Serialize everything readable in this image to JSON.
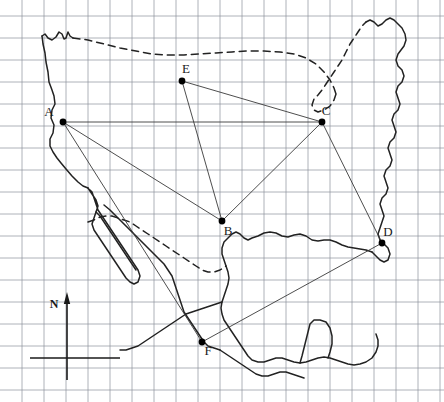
{
  "figure": {
    "type": "map",
    "title": ""
  },
  "grid": {
    "visible": true,
    "spacing_px": 22,
    "x_start": 22,
    "y_start": 16,
    "columns": 19,
    "rows": 18,
    "color": "#8a8f99",
    "line_width": 0.8
  },
  "compass": {
    "label": "N",
    "direction": "north",
    "arrow_color": "#1a1a1a",
    "axis_x": 67,
    "axis_top_y": 300,
    "axis_bottom_y": 380,
    "crossbar_y": 358,
    "crossbar_x1": 30,
    "crossbar_x2": 120,
    "label_x": 54,
    "label_y": 308
  },
  "points": [
    {
      "id": "A",
      "label": "A",
      "x": 63,
      "y": 122,
      "label_dx": -14,
      "label_dy": -6
    },
    {
      "id": "B",
      "label": "B",
      "x": 222,
      "y": 221,
      "label_dx": 6,
      "label_dy": 14
    },
    {
      "id": "C",
      "label": "C",
      "x": 322,
      "y": 122,
      "label_dx": 4,
      "label_dy": -7
    },
    {
      "id": "D",
      "label": "D",
      "x": 382,
      "y": 243,
      "label_dx": 6,
      "label_dy": -7
    },
    {
      "id": "E",
      "label": "E",
      "x": 182,
      "y": 81,
      "label_dx": 4,
      "label_dy": -8
    },
    {
      "id": "F",
      "label": "F",
      "x": 202,
      "y": 342,
      "label_dx": 6,
      "label_dy": 13
    }
  ],
  "connections": [
    {
      "from": "A",
      "to": "C"
    },
    {
      "from": "A",
      "to": "B"
    },
    {
      "from": "A",
      "to": "F"
    },
    {
      "from": "E",
      "to": "C"
    },
    {
      "from": "E",
      "to": "B"
    },
    {
      "from": "C",
      "to": "B"
    },
    {
      "from": "C",
      "to": "D"
    },
    {
      "from": "D",
      "to": "F"
    }
  ],
  "colors": {
    "grid": "#8a8f99",
    "coastline": "#222222",
    "border_dashed": "#222222",
    "connection_line": "#3a3a3a",
    "point_fill": "#000000",
    "label_text": "#1a1a1a",
    "background": "#ffffff"
  },
  "boundaries": {
    "dashed_segments": [
      "canada-us-northern-border",
      "great-lakes-boundary",
      "us-mexico-border"
    ],
    "solid_segments": [
      "pacific-coast",
      "atlantic-coast",
      "gulf-coast",
      "baja-california",
      "mexico-coast"
    ]
  }
}
